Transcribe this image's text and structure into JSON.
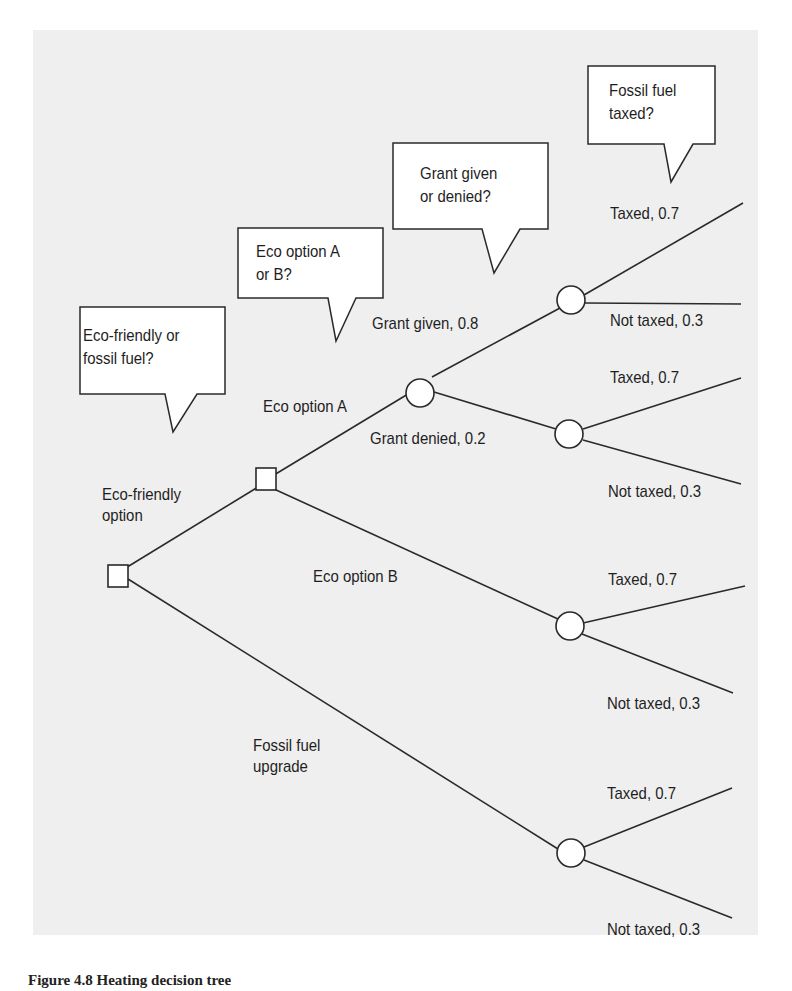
{
  "diagram": {
    "type": "decision-tree",
    "callouts": [
      {
        "id": "q1",
        "text_line1": "Eco-friendly or",
        "text_line2": "fossil fuel?"
      },
      {
        "id": "q2",
        "text_line1": "Eco option A",
        "text_line2": "or B?"
      },
      {
        "id": "q3",
        "text_line1": "Grant given",
        "text_line2": "or denied?"
      },
      {
        "id": "q4",
        "text_line1": "Fossil fuel",
        "text_line2": "taxed?"
      }
    ],
    "branches": {
      "eco_friendly_line1": "Eco-friendly",
      "eco_friendly_line2": "option",
      "fossil_upgrade_line1": "Fossil fuel",
      "fossil_upgrade_line2": "upgrade",
      "eco_a": "Eco option A",
      "eco_b": "Eco option B",
      "grant_given": "Grant given, 0.8",
      "grant_denied": "Grant denied, 0.2",
      "given_taxed": "Taxed, 0.7",
      "given_not_taxed": "Not taxed, 0.3",
      "denied_taxed": "Taxed, 0.7",
      "denied_not_taxed": "Not taxed, 0.3",
      "b_taxed": "Taxed, 0.7",
      "b_not_taxed": "Not taxed, 0.3",
      "fossil_taxed": "Taxed, 0.7",
      "fossil_not_taxed": "Not taxed, 0.3"
    },
    "nodes": [
      {
        "id": "root",
        "kind": "decision"
      },
      {
        "id": "eco",
        "kind": "decision"
      },
      {
        "id": "grant",
        "kind": "chance"
      },
      {
        "id": "tax_given",
        "kind": "chance"
      },
      {
        "id": "tax_denied",
        "kind": "chance"
      },
      {
        "id": "tax_b",
        "kind": "chance"
      },
      {
        "id": "tax_fossil",
        "kind": "chance"
      }
    ],
    "colors": {
      "line": "#2a2a2a",
      "panel": "#efefef",
      "node_fill": "#ffffff"
    }
  },
  "caption": {
    "text": "Figure 4.8  Heating decision tree"
  }
}
